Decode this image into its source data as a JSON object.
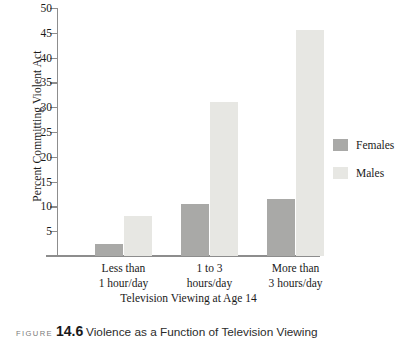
{
  "chart_data": {
    "type": "bar",
    "title": "",
    "xlabel": "Television Viewing at Age 14",
    "ylabel": "Percent Committing Violent Act",
    "categories": [
      "Less than 1 hour/day",
      "1 to 3 hours/day",
      "More than 3 hours/day"
    ],
    "category_lines": [
      [
        "Less than",
        "1 hour/day"
      ],
      [
        "1 to 3",
        "hours/day"
      ],
      [
        "More than",
        "3 hours/day"
      ]
    ],
    "series": [
      {
        "name": "Females",
        "values": [
          2.5,
          10.5,
          11.5
        ],
        "color": "#a9a9a7"
      },
      {
        "name": "Males",
        "values": [
          8,
          31,
          45.5
        ],
        "color": "#e7e7e3"
      }
    ],
    "ylim": [
      0,
      50
    ],
    "yticks": [
      5,
      10,
      15,
      20,
      25,
      30,
      35,
      40,
      45,
      50
    ],
    "ytick_labels": [
      "5",
      "10",
      "15",
      "20",
      "25",
      "30",
      "35",
      "40",
      "45",
      "50"
    ],
    "grid": false,
    "legend_position": "right",
    "axis_color": "#8d8d8d"
  },
  "legend": {
    "entries": [
      {
        "label": "Females",
        "color": "#a9a9a7"
      },
      {
        "label": "Males",
        "color": "#e7e7e3"
      }
    ]
  },
  "caption": {
    "label": "FIGURE",
    "number": "14.6",
    "text": "Violence as a Function of Television Viewing"
  }
}
